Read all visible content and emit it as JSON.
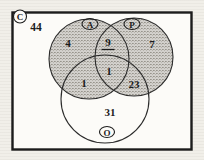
{
  "diagram_type": "venn-3set",
  "colors": {
    "ink": "#1c1c1c",
    "shading_base": "#d2d0cc",
    "shading_dot": "#97948c",
    "paper": "#f1efe9",
    "box_fill": "#fcfbf8"
  },
  "diagram": {
    "universe": {
      "label": "C",
      "outside_count": "44"
    },
    "sets": {
      "a": {
        "label": "A",
        "shaded": true
      },
      "p": {
        "label": "P",
        "shaded": true
      },
      "o": {
        "label": "O",
        "shaded": false
      }
    },
    "regions": {
      "a_only": "4",
      "a_and_p": "9",
      "p_only": "7",
      "a_p_o": "1",
      "a_and_o": "1",
      "p_and_o": "23",
      "o_only": "31"
    }
  }
}
